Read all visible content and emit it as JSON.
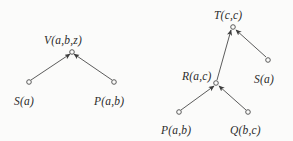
{
  "figure": {
    "background_color": "#fbfbfa",
    "ink_color": "#4a4a4a",
    "text_color": "#2b2b2b"
  },
  "trees": [
    {
      "id": "left-tree",
      "root": "V(a,b,z)",
      "nodes": [
        {
          "name": "root",
          "label": "V(a,b,z)",
          "x": 72,
          "y": 52,
          "label_x": 44,
          "label_y": 35,
          "marker": "open-circle"
        },
        {
          "name": "leaf-left",
          "label": "S(a)",
          "x": 29,
          "y": 82,
          "label_x": 14,
          "label_y": 96,
          "marker": "open-circle"
        },
        {
          "name": "leaf-right",
          "label": "P(a,b)",
          "x": 114,
          "y": 82,
          "label_x": 94,
          "label_y": 96,
          "marker": "open-circle"
        }
      ],
      "edges": [
        {
          "name": "edge-S-to-V",
          "from": "leaf-left",
          "to": "root",
          "x1": 31,
          "y1": 80,
          "x2": 70,
          "y2": 54
        },
        {
          "name": "edge-P-to-V",
          "from": "leaf-right",
          "to": "root",
          "x1": 112,
          "y1": 80,
          "x2": 74,
          "y2": 54
        }
      ]
    },
    {
      "id": "right-tree",
      "root": "T(c,c)",
      "nodes": [
        {
          "name": "root",
          "label": "T(c,c)",
          "x": 233,
          "y": 27,
          "label_x": 214,
          "label_y": 10,
          "marker": "open-circle"
        },
        {
          "name": "inner-R",
          "label": "R(a,c)",
          "x": 216,
          "y": 83,
          "label_x": 182,
          "label_y": 71,
          "marker": "open-circle"
        },
        {
          "name": "leaf-S",
          "label": "S(a)",
          "x": 268,
          "y": 60,
          "label_x": 254,
          "label_y": 74,
          "marker": "open-circle"
        },
        {
          "name": "leaf-P",
          "label": "P(a,b)",
          "x": 179,
          "y": 112,
          "label_x": 161,
          "label_y": 125,
          "marker": "open-circle"
        },
        {
          "name": "leaf-Q",
          "label": "Q(b,c)",
          "x": 248,
          "y": 112,
          "label_x": 230,
          "label_y": 125,
          "marker": "open-circle"
        }
      ],
      "edges": [
        {
          "name": "edge-R-to-T",
          "from": "inner-R",
          "to": "root",
          "x1": 217,
          "y1": 80,
          "x2": 231,
          "y2": 30
        },
        {
          "name": "edge-S-to-T",
          "from": "leaf-S",
          "to": "root",
          "x1": 266,
          "y1": 57,
          "x2": 236,
          "y2": 30
        },
        {
          "name": "edge-P-to-R",
          "from": "leaf-P",
          "to": "inner-R",
          "x1": 181,
          "y1": 110,
          "x2": 214,
          "y2": 86
        },
        {
          "name": "edge-Q-to-R",
          "from": "leaf-Q",
          "to": "inner-R",
          "x1": 246,
          "y1": 110,
          "x2": 219,
          "y2": 86
        }
      ]
    }
  ]
}
